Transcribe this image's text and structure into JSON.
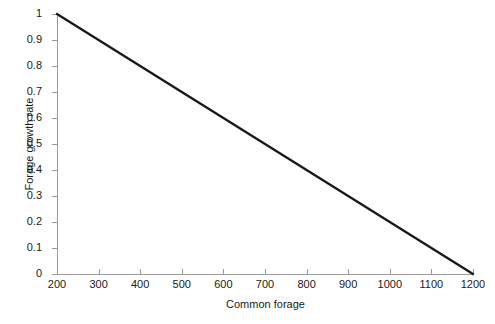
{
  "chart_data": {
    "type": "line",
    "title": "",
    "xlabel": "Common forage",
    "ylabel": "Forage growth rate",
    "xlim": [
      200,
      1200
    ],
    "ylim": [
      0,
      1
    ],
    "grid": false,
    "legend": null,
    "line_color": "#1a1a1a",
    "axis_color": "#9a9a9a",
    "background_color": "#ffffff",
    "xticks": [
      200,
      300,
      400,
      500,
      600,
      700,
      800,
      900,
      1000,
      1100,
      1200
    ],
    "xtick_labels": [
      "200",
      "300",
      "400",
      "500",
      "600",
      "700",
      "800",
      "900",
      "1000",
      "1100",
      "1200"
    ],
    "yticks": [
      0,
      0.1,
      0.2,
      0.3,
      0.4,
      0.5,
      0.6,
      0.7,
      0.8,
      0.9,
      1
    ],
    "ytick_labels": [
      "0",
      "0.1",
      "0.2",
      "0.3",
      "0.4",
      "0.5",
      "0.6",
      "0.7",
      "0.8",
      "0.9",
      "1"
    ],
    "series": [
      {
        "name": "Forage growth rate",
        "x": [
          200,
          300,
          400,
          500,
          600,
          700,
          800,
          900,
          1000,
          1100,
          1200
        ],
        "values": [
          1.0,
          0.9,
          0.8,
          0.7,
          0.6,
          0.5,
          0.4,
          0.3,
          0.2,
          0.1,
          0.0
        ]
      }
    ]
  }
}
